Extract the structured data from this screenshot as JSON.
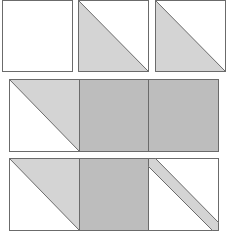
{
  "diagram": {
    "colors": {
      "outline": "#6b6b6b",
      "light_fill": "#d4d4d4",
      "medium_fill": "#bdbdbd",
      "background": "#ffffff"
    },
    "rows": [
      {
        "name": "row-1-separate-units",
        "units": [
          {
            "type": "plain-white-square"
          },
          {
            "type": "half-square-triangle-bottom-left-shaded"
          },
          {
            "type": "half-square-triangle-bottom-left-shaded"
          }
        ]
      },
      {
        "name": "row-2-joined-units",
        "units": [
          {
            "type": "half-square-triangle-top-right-shaded"
          },
          {
            "type": "solid-medium-square"
          },
          {
            "type": "solid-medium-square"
          }
        ]
      },
      {
        "name": "row-3-joined-units",
        "units": [
          {
            "type": "half-square-triangle-top-right-shaded"
          },
          {
            "type": "solid-medium-square"
          },
          {
            "type": "diagonal-stripe-square"
          }
        ]
      }
    ]
  }
}
